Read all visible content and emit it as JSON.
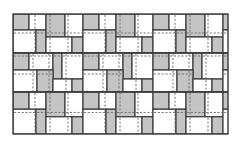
{
  "diagram": {
    "frame": {
      "x": 13,
      "y": 14,
      "width": 215,
      "height": 120
    },
    "colors": {
      "gray_tile": "#c4c4c4",
      "white_tile": "#ffffff",
      "outline": "#3a3a3a",
      "dashed": "#6e6e6e",
      "background": "#ffffff"
    },
    "unit_width": 70,
    "bands": [
      {
        "y": 0,
        "height": 39,
        "type": "A",
        "offset": 0
      },
      {
        "y": 39,
        "height": 39,
        "type": "B",
        "offset": 0
      },
      {
        "y": 78,
        "height": 42,
        "type": "A",
        "offset": 0
      }
    ],
    "band_types": {
      "A": [
        {
          "x": 0,
          "y": 0,
          "w": 16,
          "h": 16,
          "fill": "gray",
          "dv": [],
          "dh": []
        },
        {
          "x": 16,
          "y": 0,
          "w": 17,
          "h": 16,
          "fill": "white",
          "dv": [
            22
          ],
          "dh": []
        },
        {
          "x": 0,
          "y": 16,
          "w": 23,
          "h": 23,
          "fill": "white",
          "dv": [
            22
          ],
          "dh": [
            19
          ]
        },
        {
          "x": 23,
          "y": 16,
          "w": 10,
          "h": 23,
          "fill": "gray",
          "dv": [],
          "dh": [
            19
          ]
        },
        {
          "x": 33,
          "y": 0,
          "w": 19,
          "h": 23,
          "fill": "gray",
          "dv": [
            37
          ],
          "dh": [
            19
          ]
        },
        {
          "x": 52,
          "y": 0,
          "w": 18,
          "h": 23,
          "fill": "white",
          "dv": [
            55
          ],
          "dh": [
            19
          ]
        },
        {
          "x": 33,
          "y": 23,
          "w": 26,
          "h": 16,
          "fill": "white",
          "dv": [
            37,
            55
          ],
          "dh": []
        },
        {
          "x": 59,
          "y": 23,
          "w": 11,
          "h": 16,
          "fill": "gray",
          "dv": [],
          "dh": []
        }
      ],
      "B": [
        {
          "x": 0,
          "y": 0,
          "w": 16,
          "h": 17,
          "fill": "gray",
          "dv": [],
          "dh": [
            3
          ]
        },
        {
          "x": 16,
          "y": 0,
          "w": 24,
          "h": 17,
          "fill": "white",
          "dv": [
            20,
            36
          ],
          "dh": [
            3
          ]
        },
        {
          "x": 40,
          "y": 0,
          "w": 9,
          "h": 26,
          "fill": "gray",
          "dv": [],
          "dh": [
            3
          ]
        },
        {
          "x": 49,
          "y": 0,
          "w": 21,
          "h": 26,
          "fill": "white",
          "dv": [
            53
          ],
          "dh": [
            3
          ]
        },
        {
          "x": 0,
          "y": 17,
          "w": 24,
          "h": 22,
          "fill": "white",
          "dv": [
            20
          ],
          "dh": [
            21
          ]
        },
        {
          "x": 24,
          "y": 17,
          "w": 16,
          "h": 22,
          "fill": "gray",
          "dv": [
            36
          ],
          "dh": [
            21
          ]
        },
        {
          "x": 40,
          "y": 26,
          "w": 19,
          "h": 13,
          "fill": "white",
          "dv": [
            53
          ],
          "dh": []
        },
        {
          "x": 59,
          "y": 26,
          "w": 11,
          "h": 13,
          "fill": "gray",
          "dv": [],
          "dh": []
        }
      ]
    },
    "legend": {
      "gray_label": "Shaded stone",
      "white_label": "Plain stone",
      "dashed_label": "Joint / cut line"
    }
  }
}
